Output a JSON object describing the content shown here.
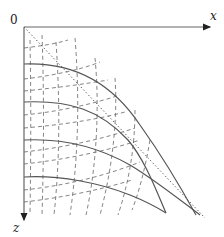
{
  "diagram": {
    "type": "ray-wavefront-diagram",
    "labels": {
      "origin": "0",
      "x_axis": "x",
      "z_axis": "z"
    },
    "colors": {
      "axis": "#555555",
      "solid_curve": "#555555",
      "dashed_curve": "#666666",
      "dotted_line": "#444444",
      "text": "#222222"
    },
    "axes": {
      "origin_px": [
        24,
        27
      ],
      "x_end_px": [
        212,
        27
      ],
      "z_end_px": [
        24,
        222
      ]
    },
    "solid_curves": [
      {
        "name": "wavefront-1",
        "start_z_px": 64,
        "path": "M24,64 C70,62 110,80 140,125 C165,160 185,195 196,215"
      },
      {
        "name": "wavefront-2",
        "start_z_px": 102,
        "path": "M24,102 C70,100 100,110 128,140 C145,160 156,190 166,213"
      },
      {
        "name": "wavefront-3",
        "start_z_px": 140,
        "path": "M24,140 C65,138 100,148 130,165 C155,180 180,200 200,215"
      },
      {
        "name": "wavefront-4",
        "start_z_px": 177,
        "path": "M24,177 C60,175 100,183 130,195 C145,201 158,208 166,213"
      }
    ],
    "dotted_line": {
      "name": "asymptote",
      "path": "M24,27 L205,218"
    },
    "dashed_horizontal_count": 7,
    "dashed_vertical_count": 6
  }
}
